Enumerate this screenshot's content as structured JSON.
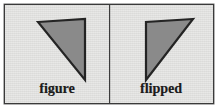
{
  "figure": {
    "background_color": "#e3e3e1",
    "border_color": "#3a3a3a",
    "divider_color": "#3c3c3c",
    "shape_fill": "#8a8a8a",
    "shape_stroke": "#242424",
    "label_color": "#1c1c1c"
  },
  "panels": [
    {
      "id": "figure",
      "label": "figure",
      "shape": "triangle",
      "points": "33,17 80,14 80,75",
      "description": "right triangle, right angle at lower right, hypotenuse from upper left to lower right"
    },
    {
      "id": "flipped",
      "label": "flipped",
      "shape": "triangle",
      "points": "84,14 37,17 37,75",
      "description": "mirror image of figure, right angle at lower left, hypotenuse from upper right to lower left"
    }
  ]
}
